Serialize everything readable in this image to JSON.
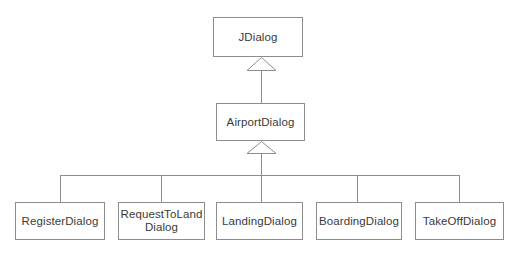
{
  "diagram": {
    "type": "uml-class-hierarchy",
    "background_color": "#ffffff",
    "line_color": "#8d8d8d",
    "text_color": "#3a3a3a",
    "relationship": "generalization",
    "classes": {
      "root": {
        "name": "JDialog",
        "label": "JDialog"
      },
      "intermediate": {
        "name": "AirportDialog",
        "label": "AirportDialog"
      },
      "leaves": [
        {
          "name": "RegisterDialog",
          "label": "RegisterDialog"
        },
        {
          "name": "RequestToLandDialog",
          "label": "RequestToLand\nDialog"
        },
        {
          "name": "LandingDialog",
          "label": "LandingDialog"
        },
        {
          "name": "BoardingDialog",
          "label": "BoardingDialog"
        },
        {
          "name": "TakeOffDialog",
          "label": "TakeOffDialog"
        }
      ]
    }
  }
}
